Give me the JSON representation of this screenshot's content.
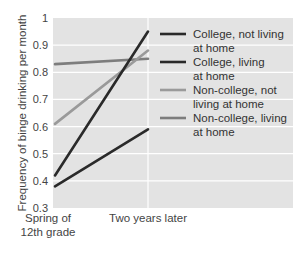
{
  "chart_data": {
    "type": "line",
    "title": "",
    "xlabel": "",
    "ylabel": "Frequency of binge drinking per month",
    "x": [
      "Spring of 12th grade",
      "Two years later"
    ],
    "x_tick_lines": [
      [
        "Spring of",
        "12th grade"
      ],
      [
        "Two years later"
      ]
    ],
    "ylim": [
      0.3,
      1.0
    ],
    "yticks": [
      "0.3",
      "0.4",
      "0.5",
      "0.6",
      "0.7",
      "0.8",
      "0.9",
      "1"
    ],
    "grid": true,
    "legend_position": "right",
    "series": [
      {
        "name": "College, not living at home",
        "legend_lines": [
          "College, not living",
          "at home"
        ],
        "color": "#2a2a2a",
        "values": [
          0.42,
          0.95
        ]
      },
      {
        "name": "College, living at home",
        "legend_lines": [
          "College, living",
          "at home"
        ],
        "color": "#2a2a2a",
        "values": [
          0.38,
          0.59
        ]
      },
      {
        "name": "Non-college, not living at home",
        "legend_lines": [
          "Non-college, not",
          "living at home"
        ],
        "color": "#9a9a9a",
        "values": [
          0.61,
          0.88
        ]
      },
      {
        "name": "Non-college, living at home",
        "legend_lines": [
          "Non-college, living",
          "at home"
        ],
        "color": "#7d7d7d",
        "values": [
          0.83,
          0.85
        ]
      }
    ]
  }
}
